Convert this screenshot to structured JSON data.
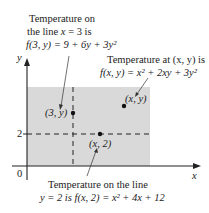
{
  "figure": {
    "annotations": {
      "vertical_line": {
        "line1": "Temperature on",
        "line2_prefix": "the line ",
        "line2_var": "x",
        "line2_suffix": " = 3 is",
        "formula": "f(3, y) = 9 + 6y + 3y²"
      },
      "point_general": {
        "line1": "Temperature at (x, y) is",
        "formula": "f(x, y) = x² + 2xy + 3y²"
      },
      "horizontal_line": {
        "line1": "Temperature on the line",
        "line2": "y = 2 is f(x, 2) = x² + 4x + 12"
      }
    },
    "axes": {
      "x_label": "x",
      "y_label": "y",
      "origin_label": "0",
      "y_tick_label": "2"
    },
    "points": {
      "p_3y": "(3, y)",
      "p_x2": "(x, 2)",
      "p_xy": "(x, y)"
    },
    "colors": {
      "region_fill": "#d9d9d9",
      "axis": "#222222",
      "text": "#222222"
    }
  }
}
